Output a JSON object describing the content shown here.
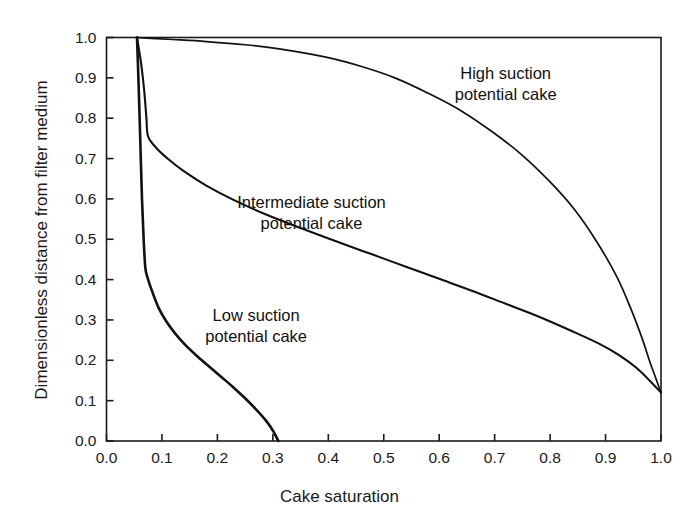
{
  "chart_data": {
    "type": "line",
    "title": "",
    "xlabel": "Cake saturation",
    "ylabel": "Dimensionless distance from filter medium",
    "xlim": [
      0.0,
      1.0
    ],
    "ylim": [
      0.0,
      1.0
    ],
    "grid": false,
    "legend": "none (curves labelled with in-plot annotations)",
    "xticks": [
      "0.0",
      "0.1",
      "0.2",
      "0.3",
      "0.4",
      "0.5",
      "0.6",
      "0.7",
      "0.8",
      "0.9",
      "1.0"
    ],
    "xtick_values": [
      0.0,
      0.1,
      0.2,
      0.3,
      0.4,
      0.5,
      0.6,
      0.7,
      0.8,
      0.9,
      1.0
    ],
    "yticks": [
      "0.0",
      "0.1",
      "0.2",
      "0.3",
      "0.4",
      "0.5",
      "0.6",
      "0.7",
      "0.8",
      "0.9",
      "1.0"
    ],
    "ytick_values": [
      0.0,
      0.1,
      0.2,
      0.3,
      0.4,
      0.5,
      0.6,
      0.7,
      0.8,
      0.9,
      1.0
    ],
    "series": [
      {
        "name": "High suction potential cake",
        "points": [
          [
            0.055,
            1.0
          ],
          [
            0.08,
            0.998
          ],
          [
            0.12,
            0.995
          ],
          [
            0.18,
            0.99
          ],
          [
            0.25,
            0.982
          ],
          [
            0.32,
            0.97
          ],
          [
            0.4,
            0.95
          ],
          [
            0.46,
            0.928
          ],
          [
            0.52,
            0.9
          ],
          [
            0.58,
            0.862
          ],
          [
            0.64,
            0.818
          ],
          [
            0.7,
            0.762
          ],
          [
            0.75,
            0.708
          ],
          [
            0.8,
            0.642
          ],
          [
            0.845,
            0.572
          ],
          [
            0.885,
            0.492
          ],
          [
            0.92,
            0.408
          ],
          [
            0.945,
            0.33
          ],
          [
            0.965,
            0.258
          ],
          [
            0.98,
            0.196
          ],
          [
            0.99,
            0.158
          ],
          [
            1.0,
            0.12
          ]
        ]
      },
      {
        "name": "Intermediate suction potential cake",
        "points": [
          [
            0.055,
            1.0
          ],
          [
            0.062,
            0.94
          ],
          [
            0.068,
            0.868
          ],
          [
            0.072,
            0.8
          ],
          [
            0.075,
            0.755
          ],
          [
            0.09,
            0.726
          ],
          [
            0.11,
            0.7
          ],
          [
            0.14,
            0.668
          ],
          [
            0.18,
            0.633
          ],
          [
            0.23,
            0.597
          ],
          [
            0.29,
            0.56
          ],
          [
            0.35,
            0.528
          ],
          [
            0.42,
            0.492
          ],
          [
            0.48,
            0.462
          ],
          [
            0.54,
            0.432
          ],
          [
            0.6,
            0.402
          ],
          [
            0.66,
            0.372
          ],
          [
            0.72,
            0.34
          ],
          [
            0.78,
            0.308
          ],
          [
            0.84,
            0.272
          ],
          [
            0.89,
            0.24
          ],
          [
            0.925,
            0.212
          ],
          [
            0.955,
            0.182
          ],
          [
            0.978,
            0.152
          ],
          [
            1.0,
            0.12
          ]
        ]
      },
      {
        "name": "Low suction potential cake",
        "points": [
          [
            0.055,
            1.0
          ],
          [
            0.058,
            0.88
          ],
          [
            0.061,
            0.74
          ],
          [
            0.064,
            0.6
          ],
          [
            0.067,
            0.5
          ],
          [
            0.07,
            0.43
          ],
          [
            0.074,
            0.405
          ],
          [
            0.082,
            0.372
          ],
          [
            0.094,
            0.33
          ],
          [
            0.108,
            0.296
          ],
          [
            0.124,
            0.266
          ],
          [
            0.142,
            0.238
          ],
          [
            0.162,
            0.212
          ],
          [
            0.184,
            0.186
          ],
          [
            0.206,
            0.16
          ],
          [
            0.228,
            0.134
          ],
          [
            0.25,
            0.106
          ],
          [
            0.27,
            0.078
          ],
          [
            0.288,
            0.05
          ],
          [
            0.3,
            0.026
          ],
          [
            0.31,
            0.0
          ]
        ]
      }
    ],
    "annotations": [
      {
        "id": "high",
        "line1": "High suction",
        "line2": "potential cake",
        "x": 0.72,
        "y": 0.885
      },
      {
        "id": "inter",
        "line1": "Intermediate suction",
        "line2": "potential cake",
        "x": 0.37,
        "y": 0.565
      },
      {
        "id": "low",
        "line1": "Low suction",
        "line2": "potential cake",
        "x": 0.27,
        "y": 0.285
      }
    ]
  }
}
